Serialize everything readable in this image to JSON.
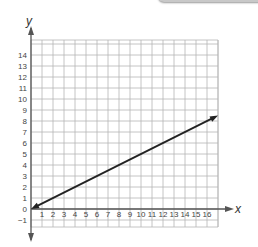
{
  "chart_data": {
    "type": "line",
    "title": "",
    "xlabel": "x",
    "ylabel": "y",
    "xlim": [
      -0.5,
      17
    ],
    "ylim": [
      -1.6,
      15
    ],
    "grid": true,
    "x_ticks": [
      "1",
      "2",
      "3",
      "4",
      "5",
      "6",
      "7",
      "8",
      "9",
      "10",
      "11",
      "12",
      "13",
      "14",
      "15",
      "16"
    ],
    "y_ticks": [
      "-1",
      "0",
      "1",
      "2",
      "3",
      "4",
      "5",
      "6",
      "7",
      "8",
      "9",
      "10",
      "11",
      "12",
      "13",
      "14"
    ],
    "series": [
      {
        "name": "line",
        "equation": "y = 0.5x",
        "x": [
          0,
          17
        ],
        "y": [
          0,
          8.5
        ],
        "arrows": "both",
        "color": "#222222"
      }
    ]
  }
}
